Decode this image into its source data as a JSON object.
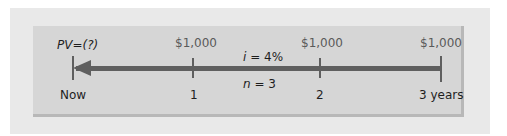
{
  "diagram": {
    "type": "timeline",
    "pv_label": "PV=(?)",
    "cash_flows": [
      "$1,000",
      "$1,000",
      "$1,000"
    ],
    "rate_label": "i = 4%",
    "periods_label": "n = 3",
    "time_labels": [
      "Now",
      "1",
      "2",
      "3 years"
    ],
    "colors": {
      "outer_panel": "#e9e9e9",
      "inner_panel": "#d6d6d6",
      "line": "#5f5f5f",
      "text": "#1e1e1e",
      "cash_text": "#5a5a5a"
    }
  }
}
